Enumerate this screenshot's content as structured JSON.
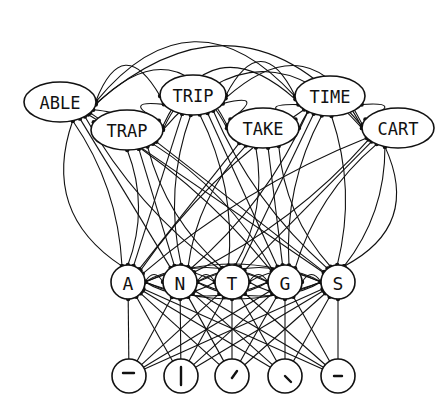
{
  "diagram": {
    "levels": [
      {
        "name": "word",
        "nodes": [
          {
            "id": "ABLE",
            "label": "ABLE",
            "x": 60,
            "y": 102,
            "rx": 36,
            "ry": 20
          },
          {
            "id": "TRIP",
            "label": "TRIP",
            "x": 193,
            "y": 95,
            "rx": 33,
            "ry": 20
          },
          {
            "id": "TIME",
            "label": "TIME",
            "x": 330,
            "y": 96,
            "rx": 35,
            "ry": 20
          },
          {
            "id": "TRAP",
            "label": "TRAP",
            "x": 127,
            "y": 130,
            "rx": 36,
            "ry": 20
          },
          {
            "id": "TAKE",
            "label": "TAKE",
            "x": 263,
            "y": 128,
            "rx": 36,
            "ry": 20
          },
          {
            "id": "CART",
            "label": "CART",
            "x": 398,
            "y": 128,
            "rx": 36,
            "ry": 20
          }
        ]
      },
      {
        "name": "letter",
        "nodes": [
          {
            "id": "A",
            "label": "A",
            "x": 128,
            "y": 282,
            "r": 17
          },
          {
            "id": "N",
            "label": "N",
            "x": 180,
            "y": 282,
            "r": 17
          },
          {
            "id": "T",
            "label": "T",
            "x": 232,
            "y": 282,
            "r": 17
          },
          {
            "id": "G",
            "label": "G",
            "x": 285,
            "y": 282,
            "r": 17
          },
          {
            "id": "S",
            "label": "S",
            "x": 338,
            "y": 282,
            "r": 17
          }
        ]
      },
      {
        "name": "feature",
        "nodes": [
          {
            "id": "f1",
            "glyph": "horizontal-bar-top",
            "x": 129,
            "y": 376,
            "r": 17
          },
          {
            "id": "f2",
            "glyph": "vertical-bar",
            "x": 181,
            "y": 376,
            "r": 17
          },
          {
            "id": "f3",
            "glyph": "diagonal-up",
            "x": 232,
            "y": 376,
            "r": 17
          },
          {
            "id": "f4",
            "glyph": "diagonal-down",
            "x": 285,
            "y": 376,
            "r": 17
          },
          {
            "id": "f5",
            "glyph": "horizontal-bar-middle",
            "x": 338,
            "y": 376,
            "r": 17
          }
        ]
      }
    ],
    "connection_style": {
      "arrow": "filled-dot",
      "color": "#111111"
    }
  }
}
